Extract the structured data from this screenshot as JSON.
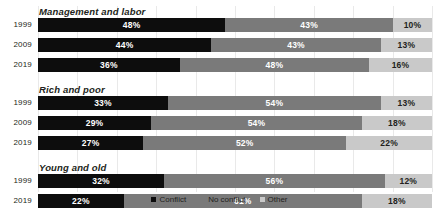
{
  "chart_data": {
    "type": "bar",
    "subtype": "stacked-horizontal-100",
    "title": "",
    "xlabel": "",
    "ylabel": "",
    "xlim": [
      0,
      100
    ],
    "grid": true,
    "legend_position": "bottom",
    "series": [
      {
        "name": "Conflict",
        "color": "#0d0d0d"
      },
      {
        "name": "No conflict",
        "color": "#7a7a7a"
      },
      {
        "name": "Other",
        "color": "#c9c9c9"
      }
    ],
    "groups": [
      {
        "title": "Management and labor",
        "rows": [
          {
            "category": "1999",
            "values": [
              48,
              43,
              10
            ],
            "labels": [
              "48%",
              "43%",
              "10%"
            ]
          },
          {
            "category": "2009",
            "values": [
              44,
              43,
              13
            ],
            "labels": [
              "44%",
              "43%",
              "13%"
            ]
          },
          {
            "category": "2019",
            "values": [
              36,
              48,
              16
            ],
            "labels": [
              "36%",
              "48%",
              "16%"
            ]
          }
        ]
      },
      {
        "title": "Rich and poor",
        "rows": [
          {
            "category": "1999",
            "values": [
              33,
              54,
              13
            ],
            "labels": [
              "33%",
              "54%",
              "13%"
            ]
          },
          {
            "category": "2009",
            "values": [
              29,
              54,
              18
            ],
            "labels": [
              "29%",
              "54%",
              "18%"
            ]
          },
          {
            "category": "2019",
            "values": [
              27,
              52,
              22
            ],
            "labels": [
              "27%",
              "52%",
              "22%"
            ]
          }
        ]
      },
      {
        "title": "Young and old",
        "rows": [
          {
            "category": "1999",
            "values": [
              32,
              56,
              12
            ],
            "labels": [
              "32%",
              "56%",
              "12%"
            ]
          },
          {
            "category": "2019",
            "values": [
              22,
              61,
              18
            ],
            "labels": [
              "22%",
              "61%",
              "18%"
            ]
          }
        ]
      }
    ]
  },
  "legend": {
    "items": [
      {
        "label": "Conflict",
        "color": "#0d0d0d"
      },
      {
        "label": "No conflict",
        "color": "#7a7a7a"
      },
      {
        "label": "Other",
        "color": "#c9c9c9"
      }
    ]
  }
}
